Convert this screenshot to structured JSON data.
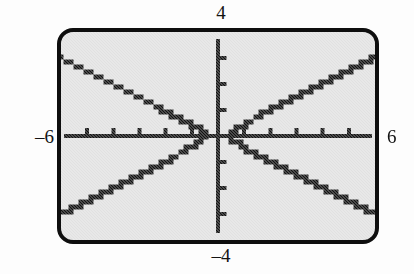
{
  "figure": {
    "kind": "graphing-calculator-screen",
    "screen_background_color": "#e1e1e1",
    "ink_color": "#111111",
    "page_background_color": "#fdfdfd"
  },
  "labels": {
    "y_max": "4",
    "y_min": "–4",
    "x_min": "–6",
    "x_max": "6"
  },
  "chart_data": {
    "type": "line",
    "title": "",
    "subtitle": "",
    "xlabel": "",
    "ylabel": "",
    "grid": false,
    "legend_position": "none",
    "xlim": [
      -6,
      6
    ],
    "ylim": [
      -4,
      4
    ],
    "x_tick_labels": [
      "–6",
      "6"
    ],
    "y_tick_labels": [
      "–4",
      "4"
    ],
    "x_ticks": [
      -5,
      -4,
      -3,
      -2,
      -1,
      1,
      2,
      3,
      4,
      5
    ],
    "y_ticks": [
      -3,
      -2,
      -1,
      1,
      2,
      3
    ],
    "x_tick_interval": 1,
    "y_tick_interval": 1,
    "axis_line_width_px": 4,
    "tick_length_px": 6,
    "tick_side_x_axis": "above",
    "tick_side_y_axis": "right",
    "curve_style": "pixelated-dotted",
    "curve_line_width_px": 5,
    "annotations": [],
    "relation": "hyperbola, horizontal transverse axis, center (0,0)",
    "equation": "x^2/0.25 - y^2/0.0625 = 1",
    "vertices": [
      [
        -0.5,
        0
      ],
      [
        0.5,
        0
      ]
    ],
    "asymptote_slopes": [
      0.5,
      -0.5
    ],
    "series": [
      {
        "name": "right branch upper",
        "x": [
          0.5,
          0.52,
          0.56,
          0.62,
          0.7,
          0.8,
          0.92,
          1.06,
          1.22,
          1.4,
          1.6,
          1.82,
          2.06,
          2.32,
          2.6,
          2.9,
          3.22,
          3.56,
          3.92,
          4.3,
          4.7,
          5.12,
          5.56,
          6.0
        ],
        "y": [
          0.0,
          0.07,
          0.13,
          0.18,
          0.25,
          0.31,
          0.39,
          0.47,
          0.56,
          0.65,
          0.76,
          0.88,
          1.0,
          1.13,
          1.28,
          1.43,
          1.59,
          1.76,
          1.94,
          2.13,
          2.33,
          2.54,
          2.76,
          2.98
        ]
      },
      {
        "name": "right branch lower",
        "x": [
          0.5,
          0.52,
          0.56,
          0.62,
          0.7,
          0.8,
          0.92,
          1.06,
          1.22,
          1.4,
          1.6,
          1.82,
          2.06,
          2.32,
          2.6,
          2.9,
          3.22,
          3.56,
          3.92,
          4.3,
          4.7,
          5.12,
          5.56,
          6.0
        ],
        "y": [
          0.0,
          -0.07,
          -0.13,
          -0.18,
          -0.25,
          -0.31,
          -0.39,
          -0.47,
          -0.56,
          -0.65,
          -0.76,
          -0.88,
          -1.0,
          -1.13,
          -1.28,
          -1.43,
          -1.59,
          -1.76,
          -1.94,
          -2.13,
          -2.33,
          -2.54,
          -2.76,
          -2.98
        ]
      },
      {
        "name": "left branch upper",
        "x": [
          -0.5,
          -0.52,
          -0.56,
          -0.62,
          -0.7,
          -0.8,
          -0.92,
          -1.06,
          -1.22,
          -1.4,
          -1.6,
          -1.82,
          -2.06,
          -2.32,
          -2.6,
          -2.9,
          -3.22,
          -3.56,
          -3.92,
          -4.3,
          -4.7,
          -5.12,
          -5.56,
          -6.0
        ],
        "y": [
          0.0,
          0.07,
          0.13,
          0.18,
          0.25,
          0.31,
          0.39,
          0.47,
          0.56,
          0.65,
          0.76,
          0.88,
          1.0,
          1.13,
          1.28,
          1.43,
          1.59,
          1.76,
          1.94,
          2.13,
          2.33,
          2.54,
          2.76,
          2.98
        ]
      },
      {
        "name": "left branch lower",
        "x": [
          -0.5,
          -0.52,
          -0.56,
          -0.62,
          -0.7,
          -0.8,
          -0.92,
          -1.06,
          -1.22,
          -1.4,
          -1.6,
          -1.82,
          -2.06,
          -2.32,
          -2.6,
          -2.9,
          -3.22,
          -3.56,
          -3.92,
          -4.3,
          -4.7,
          -5.12,
          -5.56,
          -6.0
        ],
        "y": [
          0.0,
          -0.07,
          -0.13,
          -0.18,
          -0.25,
          -0.31,
          -0.39,
          -0.47,
          -0.56,
          -0.65,
          -0.76,
          -0.88,
          -1.0,
          -1.13,
          -1.28,
          -1.43,
          -1.59,
          -1.76,
          -1.94,
          -2.13,
          -2.33,
          -2.54,
          -2.76,
          -2.98
        ]
      }
    ]
  }
}
